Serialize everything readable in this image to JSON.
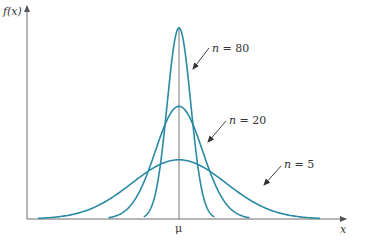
{
  "chart_data": {
    "type": "line",
    "title": "",
    "xlabel": "x",
    "ylabel": "f(x)",
    "x_ticks": [
      "μ"
    ],
    "grid": false,
    "legend": "inline annotations with arrows",
    "series": [
      {
        "name": "n = 80",
        "label": "n = 80",
        "peak_rel": 1.0,
        "spread_rel": 0.25
      },
      {
        "name": "n = 20",
        "label": "n = 20",
        "peak_rel": 0.59,
        "spread_rel": 0.5
      },
      {
        "name": "n = 5",
        "label": "n = 5",
        "peak_rel": 0.31,
        "spread_rel": 1.0
      }
    ],
    "colors": {
      "curve": "#2a8aa3",
      "axis": "#6d6d6d",
      "arrow": "#444444",
      "center_line": "#777777"
    }
  },
  "axes": {
    "y_label": "f(x)",
    "x_label": "x",
    "center_label": "μ"
  },
  "annotations": {
    "n80": {
      "var": "n",
      "eq": " = 80"
    },
    "n20": {
      "var": "n",
      "eq": " = 20"
    },
    "n5": {
      "var": "n",
      "eq": " = 5"
    }
  }
}
